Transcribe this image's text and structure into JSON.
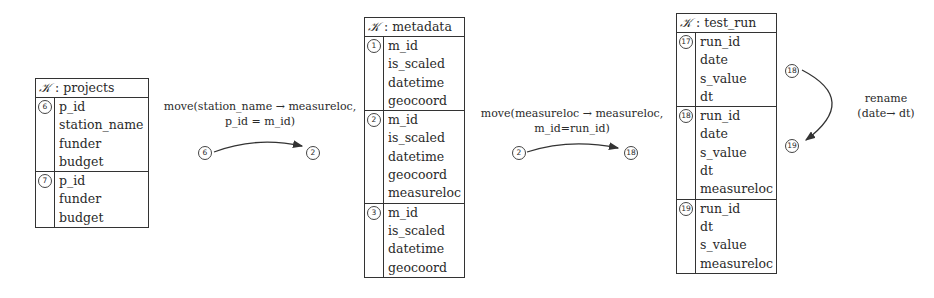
{
  "tables": [
    {
      "key_symbol": "𝒦",
      "name": "projects",
      "groups": [
        {
          "id": "6",
          "fields": [
            "p_id",
            "station_name",
            "funder",
            "budget"
          ]
        },
        {
          "id": "7",
          "fields": [
            "p_id",
            "funder",
            "budget"
          ]
        }
      ]
    },
    {
      "key_symbol": "𝒦",
      "name": "metadata",
      "groups": [
        {
          "id": "1",
          "fields": [
            "m_id",
            "is_scaled",
            "datetime",
            "geocoord"
          ]
        },
        {
          "id": "2",
          "fields": [
            "m_id",
            "is_scaled",
            "datetime",
            "geocoord",
            "measureloc"
          ]
        },
        {
          "id": "3",
          "fields": [
            "m_id",
            "is_scaled",
            "datetime",
            "geocoord"
          ]
        }
      ]
    },
    {
      "key_symbol": "𝒦",
      "name": "test_run",
      "groups": [
        {
          "id": "17",
          "fields": [
            "run_id",
            "date",
            "s_value",
            "dt"
          ]
        },
        {
          "id": "18",
          "fields": [
            "run_id",
            "date",
            "s_value",
            "dt",
            "measureloc"
          ]
        },
        {
          "id": "19",
          "fields": [
            "run_id",
            "dt",
            "s_value",
            "measureloc"
          ]
        }
      ]
    }
  ],
  "transformations": [
    {
      "label_line1": "move(station_name → measureloc,",
      "label_line2": "p_id = m_id)",
      "from": "6",
      "to": "2"
    },
    {
      "label_line1": "move(measureloc → measureloc,",
      "label_line2": "m_id=run_id)",
      "from": "2",
      "to": "18"
    },
    {
      "label_line1": "rename",
      "label_line2": "(date→ dt)",
      "from": "18",
      "to": "19"
    }
  ],
  "separator": ":"
}
